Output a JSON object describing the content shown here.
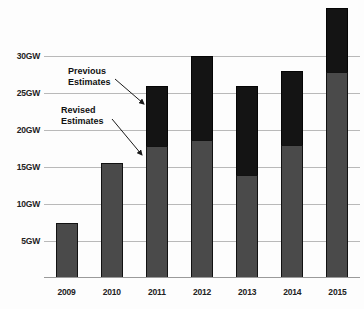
{
  "chart_data": {
    "type": "bar",
    "title": "",
    "subtitle": "",
    "xlabel": "",
    "ylabel": "",
    "categories": [
      "2009",
      "2010",
      "2011",
      "2012",
      "2013",
      "2014",
      "2015"
    ],
    "series": [
      {
        "name": "Revised Estimates",
        "color": "#4a4a4a",
        "values": [
          7.5,
          15.5,
          17.8,
          18.7,
          14.0,
          18.0,
          27.8
        ]
      },
      {
        "name": "Previous Estimates",
        "color": "#141414",
        "values": [
          0,
          0,
          26.0,
          30.0,
          26.0,
          28.0,
          36.5
        ]
      }
    ],
    "stacked_total_values": [
      7.5,
      15.5,
      26.0,
      30.0,
      26.0,
      28.0,
      36.5
    ],
    "ylim": [
      0,
      37.6
    ],
    "ytick_values": [
      5,
      10,
      15,
      20,
      25,
      30
    ],
    "ytick_labels": [
      "5GW",
      "10GW",
      "15GW",
      "20GW",
      "25GW",
      "30GW"
    ],
    "unit": "GW",
    "grid": true,
    "legend_position": "none",
    "annotations": [
      {
        "id": "previous",
        "text_line1": "Previous",
        "text_line2": "Estimates",
        "points_to_series": "Previous Estimates",
        "points_to_category": "2011"
      },
      {
        "id": "revised",
        "text_line1": "Revised",
        "text_line2": "Estimates",
        "points_to_series": "Revised Estimates",
        "points_to_category": "2011"
      }
    ]
  },
  "annotations": {
    "previous": {
      "line1": "Previous",
      "line2": "Estimates"
    },
    "revised": {
      "line1": "Revised",
      "line2": "Estimates"
    }
  },
  "axis": {
    "y_labels": [
      "30GW",
      "25GW",
      "20GW",
      "15GW",
      "10GW",
      "5GW"
    ],
    "x_labels": [
      "2009",
      "2010",
      "2011",
      "2012",
      "2013",
      "2014",
      "2015"
    ]
  },
  "colors": {
    "revised_estimates": "#4a4a4a",
    "previous_estimates": "#141414",
    "gridline": "#b9b9b9",
    "background": "#fdfdfd",
    "text": "#222222"
  }
}
